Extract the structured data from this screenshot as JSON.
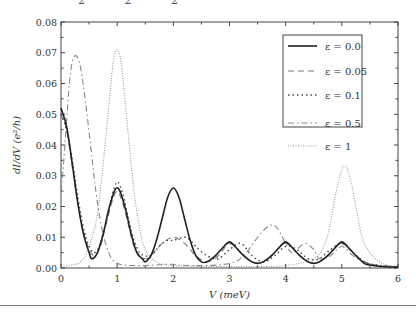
{
  "top_fragment": "2 2 2",
  "chart_data": {
    "type": "line",
    "title": "",
    "xlabel": "V (meV)",
    "ylabel": "dI/dV (e²/h)",
    "xlim": [
      0,
      6
    ],
    "ylim": [
      0,
      0.08
    ],
    "x_ticks": [
      "0",
      "1",
      "2",
      "3",
      "4",
      "5",
      "6"
    ],
    "y_ticks": [
      "0.00",
      "0.01",
      "0.02",
      "0.03",
      "0.04",
      "0.05",
      "0.06",
      "0.07",
      "0.08"
    ],
    "grid": false,
    "legend_position": "upper right",
    "series": [
      {
        "name": "ε = 0.0",
        "style": "solid",
        "color": "#222222",
        "x": [
          0,
          0.1,
          0.2,
          0.3,
          0.4,
          0.5,
          0.55,
          0.65,
          0.75,
          0.85,
          0.95,
          1.0,
          1.05,
          1.15,
          1.25,
          1.35,
          1.45,
          1.5,
          1.6,
          1.7,
          1.8,
          1.9,
          2.0,
          2.1,
          2.2,
          2.3,
          2.4,
          2.5,
          2.6,
          2.75,
          2.9,
          3.0,
          3.1,
          3.25,
          3.4,
          3.5,
          3.6,
          3.75,
          3.9,
          4.0,
          4.1,
          4.25,
          4.4,
          4.5,
          4.6,
          4.75,
          4.9,
          5.0,
          5.1,
          5.25,
          5.4,
          5.5,
          5.7,
          6.0
        ],
        "values": [
          0.052,
          0.046,
          0.034,
          0.021,
          0.011,
          0.005,
          0.003,
          0.005,
          0.011,
          0.019,
          0.025,
          0.026,
          0.025,
          0.019,
          0.011,
          0.005,
          0.003,
          0.002,
          0.004,
          0.009,
          0.016,
          0.023,
          0.026,
          0.023,
          0.016,
          0.009,
          0.004,
          0.002,
          0.002,
          0.004,
          0.007,
          0.0085,
          0.007,
          0.004,
          0.002,
          0.0015,
          0.002,
          0.004,
          0.007,
          0.0085,
          0.007,
          0.004,
          0.002,
          0.0015,
          0.002,
          0.004,
          0.007,
          0.0085,
          0.007,
          0.004,
          0.0015,
          0.001,
          0.0005,
          0.0003
        ]
      },
      {
        "name": "ε = 0.05",
        "style": "dashed",
        "color": "#777777",
        "x": [
          0,
          0.1,
          0.2,
          0.3,
          0.4,
          0.5,
          0.6,
          0.7,
          0.8,
          0.9,
          1.0,
          1.1,
          1.2,
          1.3,
          1.4,
          1.5,
          1.6,
          1.8,
          2.0,
          2.2,
          2.4,
          2.6,
          2.8,
          3.0,
          3.2,
          3.4,
          3.6,
          3.8,
          4.0,
          4.2,
          4.4,
          4.6,
          4.8,
          5.0,
          5.2,
          5.4,
          5.6,
          6.0
        ],
        "values": [
          0.05,
          0.045,
          0.033,
          0.021,
          0.012,
          0.006,
          0.004,
          0.007,
          0.014,
          0.021,
          0.025,
          0.021,
          0.014,
          0.007,
          0.004,
          0.003,
          0.004,
          0.008,
          0.01,
          0.008,
          0.004,
          0.002,
          0.004,
          0.008,
          0.005,
          0.002,
          0.002,
          0.005,
          0.008,
          0.005,
          0.002,
          0.002,
          0.005,
          0.008,
          0.005,
          0.002,
          0.001,
          0.0003
        ]
      },
      {
        "name": "ε = 0.1",
        "style": "dotted",
        "color": "#444444",
        "x": [
          0,
          0.1,
          0.2,
          0.3,
          0.4,
          0.5,
          0.6,
          0.7,
          0.8,
          0.9,
          1.0,
          1.1,
          1.2,
          1.3,
          1.4,
          1.5,
          1.6,
          1.7,
          1.8,
          1.9,
          2.0,
          2.2,
          2.3,
          2.4,
          2.6,
          2.8,
          3.0,
          3.2,
          3.4,
          3.6,
          3.8,
          4.0,
          4.2,
          4.4,
          4.6,
          4.8,
          5.0,
          5.2,
          5.4,
          5.6,
          6.0
        ],
        "values": [
          0.05,
          0.045,
          0.035,
          0.023,
          0.013,
          0.007,
          0.005,
          0.008,
          0.015,
          0.023,
          0.028,
          0.024,
          0.016,
          0.009,
          0.005,
          0.004,
          0.004,
          0.006,
          0.008,
          0.009,
          0.009,
          0.01,
          0.009,
          0.007,
          0.004,
          0.003,
          0.006,
          0.008,
          0.004,
          0.002,
          0.004,
          0.007,
          0.006,
          0.003,
          0.003,
          0.006,
          0.008,
          0.005,
          0.002,
          0.001,
          0.0003
        ]
      },
      {
        "name": "ε = 0.5",
        "style": "dash-dot",
        "color": "#888888",
        "x": [
          0,
          0.05,
          0.1,
          0.15,
          0.2,
          0.27,
          0.35,
          0.45,
          0.55,
          0.65,
          0.75,
          0.85,
          0.95,
          1.1,
          1.3,
          1.5,
          1.7,
          1.9,
          2.0,
          2.1,
          2.3,
          2.5,
          2.8,
          3.1,
          3.3,
          3.5,
          3.65,
          3.75,
          3.85,
          4.0,
          4.1,
          4.2,
          4.35,
          4.5,
          4.6,
          4.8,
          5.0,
          5.2,
          5.4,
          5.7,
          6.0
        ],
        "values": [
          0.025,
          0.035,
          0.048,
          0.06,
          0.067,
          0.069,
          0.065,
          0.052,
          0.036,
          0.021,
          0.011,
          0.005,
          0.002,
          0.001,
          0.0008,
          0.0008,
          0.001,
          0.0012,
          0.0012,
          0.001,
          0.0008,
          0.0008,
          0.001,
          0.002,
          0.005,
          0.01,
          0.013,
          0.014,
          0.013,
          0.008,
          0.005,
          0.006,
          0.008,
          0.006,
          0.003,
          0.004,
          0.007,
          0.004,
          0.002,
          0.0005,
          0.0002
        ]
      },
      {
        "name": "ε = 1",
        "style": "dotted-fine",
        "color": "#999999",
        "x": [
          0,
          0.2,
          0.4,
          0.6,
          0.7,
          0.8,
          0.9,
          0.95,
          1.0,
          1.05,
          1.1,
          1.2,
          1.3,
          1.4,
          1.5,
          1.7,
          2.0,
          2.5,
          3.0,
          3.5,
          4.0,
          4.5,
          4.7,
          4.8,
          4.9,
          5.0,
          5.05,
          5.1,
          5.2,
          5.3,
          5.4,
          5.6,
          5.8,
          6.0
        ],
        "values": [
          0.0005,
          0.001,
          0.003,
          0.013,
          0.025,
          0.043,
          0.062,
          0.069,
          0.071,
          0.069,
          0.062,
          0.043,
          0.025,
          0.013,
          0.006,
          0.002,
          0.0008,
          0.0005,
          0.0005,
          0.0005,
          0.0008,
          0.003,
          0.008,
          0.015,
          0.025,
          0.032,
          0.033,
          0.032,
          0.025,
          0.015,
          0.008,
          0.003,
          0.001,
          0.0005
        ]
      }
    ]
  }
}
